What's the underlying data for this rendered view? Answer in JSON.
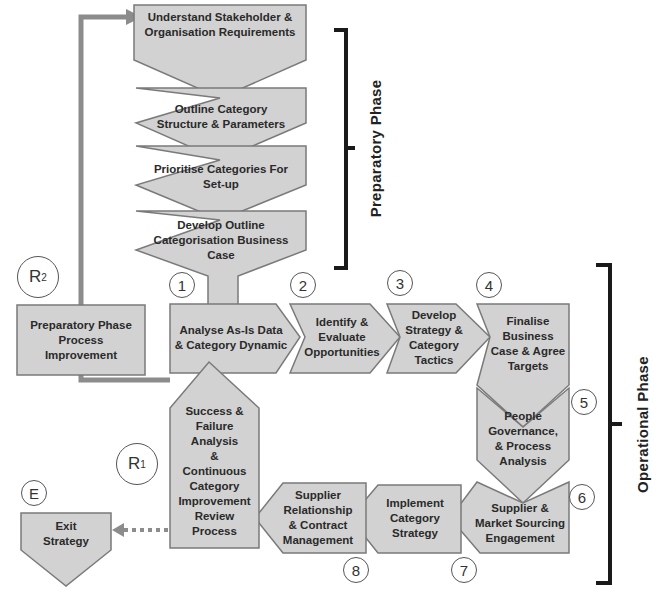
{
  "preparatory_phase": {
    "label": "Preparatory Phase",
    "steps": [
      {
        "id": "p1",
        "lines": [
          "Understand Stakeholder &",
          "Organisation Requirements"
        ]
      },
      {
        "id": "p2",
        "lines": [
          "Outline Category",
          "Structure & Parameters"
        ]
      },
      {
        "id": "p3",
        "lines": [
          "Prioritise Categories For",
          "Set-up"
        ]
      },
      {
        "id": "p4",
        "lines": [
          "Develop Outline",
          "Categorisation Business",
          "Case"
        ]
      }
    ]
  },
  "operational_phase": {
    "label": "Operational Phase",
    "steps": [
      {
        "number": "1",
        "lines": [
          "Analyse As-Is Data",
          "& Category Dynamic"
        ]
      },
      {
        "number": "2",
        "lines": [
          "Identify &",
          "Evaluate",
          "Opportunities"
        ]
      },
      {
        "number": "3",
        "lines": [
          "Develop",
          "Strategy &",
          "Category",
          "Tactics"
        ]
      },
      {
        "number": "4",
        "lines": [
          "Finalise",
          "Business",
          "Case & Agree",
          "Targets"
        ]
      },
      {
        "number": "5",
        "lines": [
          "People",
          "Governance,",
          "& Process",
          "Analysis"
        ]
      },
      {
        "number": "6",
        "lines": [
          "Supplier &",
          "Market Sourcing",
          "Engagement"
        ]
      },
      {
        "number": "7",
        "lines": [
          "Implement",
          "Category",
          "Strategy"
        ]
      },
      {
        "number": "8",
        "lines": [
          "Supplier",
          "Relationship",
          "& Contract",
          "Management"
        ]
      }
    ]
  },
  "review": {
    "lines": [
      "Success &",
      "Failure",
      "Analysis",
      "&",
      "Continuous",
      "Category",
      "Improvement",
      "Review",
      "Process"
    ],
    "marker": {
      "letter": "R",
      "sub": "1"
    }
  },
  "prep_improvement": {
    "lines": [
      "Preparatory Phase",
      "Process",
      "Improvement"
    ],
    "marker": {
      "letter": "R",
      "sub": "2"
    }
  },
  "exit": {
    "lines": [
      "Exit",
      "Strategy"
    ],
    "marker": "E"
  },
  "colors": {
    "shape_fill": "#d2d2d2",
    "shape_stroke": "#7a7a7a",
    "connector": "#8c8c8c",
    "bracket": "#1a1a1a"
  }
}
